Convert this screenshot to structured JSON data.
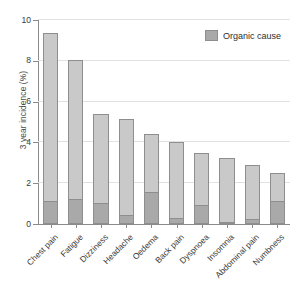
{
  "chart_data": {
    "type": "bar",
    "title": "",
    "subtitle": "",
    "xlabel": "",
    "ylabel": "3 year incidence (%)",
    "ylim": [
      0,
      10
    ],
    "yticks": [
      0,
      2,
      4,
      6,
      8,
      10
    ],
    "ytick_labels": [
      "0",
      "2",
      "4",
      "6",
      "8",
      "10"
    ],
    "grid": true,
    "stacked": true,
    "legend_position": "top-right",
    "categories": [
      "Chest pain",
      "Fatigue",
      "Dizziness",
      "Headache",
      "Oedema",
      "Back pain",
      "Dyspnoea",
      "Insomnia",
      "Abdominal pain",
      "Numbness"
    ],
    "series": [
      {
        "name": "Organic cause",
        "color": "#a9a9a9",
        "values": [
          1.15,
          1.25,
          1.05,
          0.45,
          1.55,
          0.3,
          0.95,
          0.12,
          0.25,
          1.15
        ]
      },
      {
        "name": "Total incidence",
        "color": "#c9c9c9",
        "values": [
          9.35,
          8.05,
          5.4,
          5.15,
          4.4,
          4.0,
          3.5,
          3.25,
          2.9,
          2.5
        ]
      }
    ],
    "legend": [
      {
        "label": "Organic cause",
        "color": "#a9a9a9"
      }
    ]
  },
  "colors": {
    "bar_total": "#c9c9c9",
    "bar_organic": "#a9a9a9",
    "bar_edge": "#8e8e8e",
    "gridline": "#e2e2e2",
    "axis": "#8a8a8a",
    "text": "#3a3a3a",
    "background": "#ffffff"
  }
}
